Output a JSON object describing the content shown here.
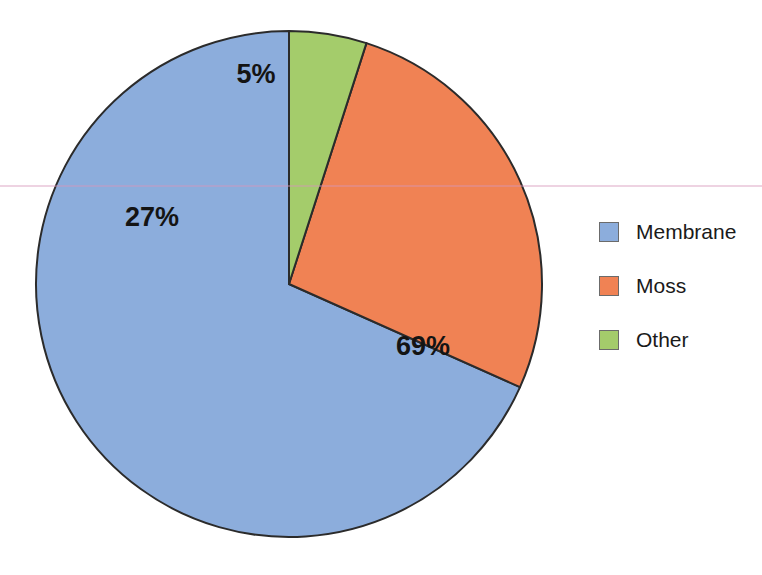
{
  "chart_data": {
    "type": "pie",
    "title": "",
    "categories": [
      "Membrane",
      "Moss",
      "Other"
    ],
    "values": [
      69,
      27,
      5
    ],
    "value_labels": [
      "69%",
      "27%",
      "5%"
    ],
    "colors": [
      "#8CADDC",
      "#F08254",
      "#A4CC6B"
    ],
    "units": "percent",
    "total": 101,
    "start_angle_deg": 0,
    "direction": "counterclockwise",
    "legend_position": "right",
    "grid": false,
    "xlabel": "",
    "ylabel": ""
  },
  "slices": [
    {
      "name": "Membrane",
      "label": "69%",
      "value": 69,
      "color": "#8CADDC",
      "label_x": 423,
      "label_y": 348
    },
    {
      "name": "Moss",
      "label": "27%",
      "value": 27,
      "color": "#F08254",
      "label_x": 152,
      "label_y": 219
    },
    {
      "name": "Other",
      "label": "5%",
      "value": 5,
      "color": "#A4CC6B",
      "label_x": 256,
      "label_y": 76
    }
  ],
  "legend": {
    "items": [
      {
        "label": "Membrane",
        "color": "#8CADDC"
      },
      {
        "label": "Moss",
        "color": "#F08254"
      },
      {
        "label": "Other",
        "color": "#A4CC6B"
      }
    ]
  },
  "style": {
    "background": "#FFFFFF",
    "outline": "#2B2B2B",
    "label_color": "#141414"
  }
}
